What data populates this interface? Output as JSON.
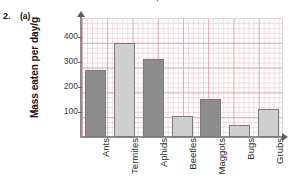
{
  "header": {
    "cut_off_line": "of 3 words correct = 1 mark, 1 or 0 words correct = 0 ma"
  },
  "question": {
    "number": "2.",
    "part": "(a)"
  },
  "chart_data": {
    "type": "bar",
    "title": "",
    "xlabel": "",
    "ylabel": "Mass eaten per day/g",
    "categories": [
      "Ants",
      "Termites",
      "Aphids",
      "Beetles",
      "Maggots",
      "Bugs",
      "Grubs"
    ],
    "values": [
      268,
      375,
      312,
      85,
      150,
      48,
      110
    ],
    "bar_colors": [
      "#8d8d8d",
      "#cfcfcf",
      "#8d8d8d",
      "#cfcfcf",
      "#8d8d8d",
      "#cfcfcf",
      "#cfcfcf"
    ],
    "ylim": [
      0,
      475
    ],
    "yticks": [
      100,
      200,
      300,
      400
    ],
    "ytick_labels": [
      "100",
      "200",
      "300",
      "400"
    ],
    "grid": true,
    "legend": "none",
    "axis_arrows": true,
    "grid_color": "#e4c4c8",
    "axis_color": "#8d8d8d"
  }
}
